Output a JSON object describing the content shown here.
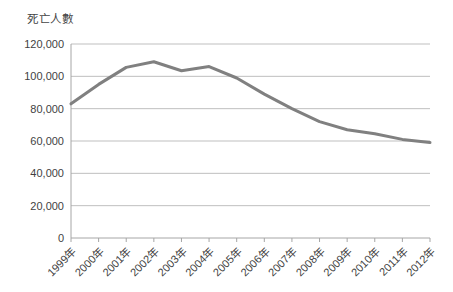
{
  "chart_data": {
    "type": "line",
    "title": "死亡人數",
    "xlabel": "",
    "ylabel": "死亡人數",
    "categories": [
      "1999年",
      "2000年",
      "2001年",
      "2002年",
      "2003年",
      "2004年",
      "2005年",
      "2006年",
      "2007年",
      "2008年",
      "2009年",
      "2010年",
      "2011年",
      "2012年"
    ],
    "values": [
      83000,
      95000,
      105500,
      109000,
      103500,
      106000,
      99000,
      89000,
      80000,
      72000,
      67000,
      64500,
      61000,
      59000
    ],
    "series": [
      {
        "name": "死亡人數",
        "values": [
          83000,
          95000,
          105500,
          109000,
          103500,
          106000,
          99000,
          89000,
          80000,
          72000,
          67000,
          64500,
          61000,
          59000
        ]
      }
    ],
    "ylim": [
      0,
      120000
    ],
    "ytick_labels": [
      "120,000",
      "100,000",
      "80,000",
      "60,000",
      "40,000",
      "20,000",
      "0"
    ],
    "ytick_values": [
      120000,
      100000,
      80000,
      60000,
      40000,
      20000,
      0
    ],
    "grid": true,
    "legend": false,
    "legend_position": "none",
    "line_color": "#808080",
    "grid_color": "#bfbfbf",
    "axis_color": "#a6a6a6",
    "background": "#ffffff"
  }
}
